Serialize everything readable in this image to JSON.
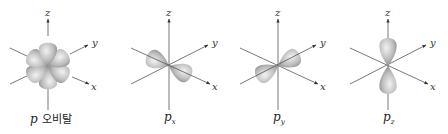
{
  "figure": {
    "panels": [
      {
        "id": "p-all",
        "caption_main": "p",
        "caption_sub": "",
        "caption_suffix": "오비탈",
        "axes": {
          "z": "z",
          "y": "y",
          "x": "x"
        }
      },
      {
        "id": "px",
        "caption_main": "p",
        "caption_sub": "x",
        "caption_suffix": "",
        "axes": {
          "z": "z",
          "y": "y",
          "x": "x"
        }
      },
      {
        "id": "py",
        "caption_main": "p",
        "caption_sub": "y",
        "caption_suffix": "",
        "axes": {
          "z": "z",
          "y": "y",
          "x": "x"
        }
      },
      {
        "id": "pz",
        "caption_main": "p",
        "caption_sub": "z",
        "caption_suffix": "",
        "axes": {
          "z": "z",
          "y": "y",
          "x": "x"
        }
      }
    ],
    "colors": {
      "lobe_light": "#e6e6e6",
      "lobe_dark": "#8a8a8a",
      "axis": "#555555"
    }
  }
}
